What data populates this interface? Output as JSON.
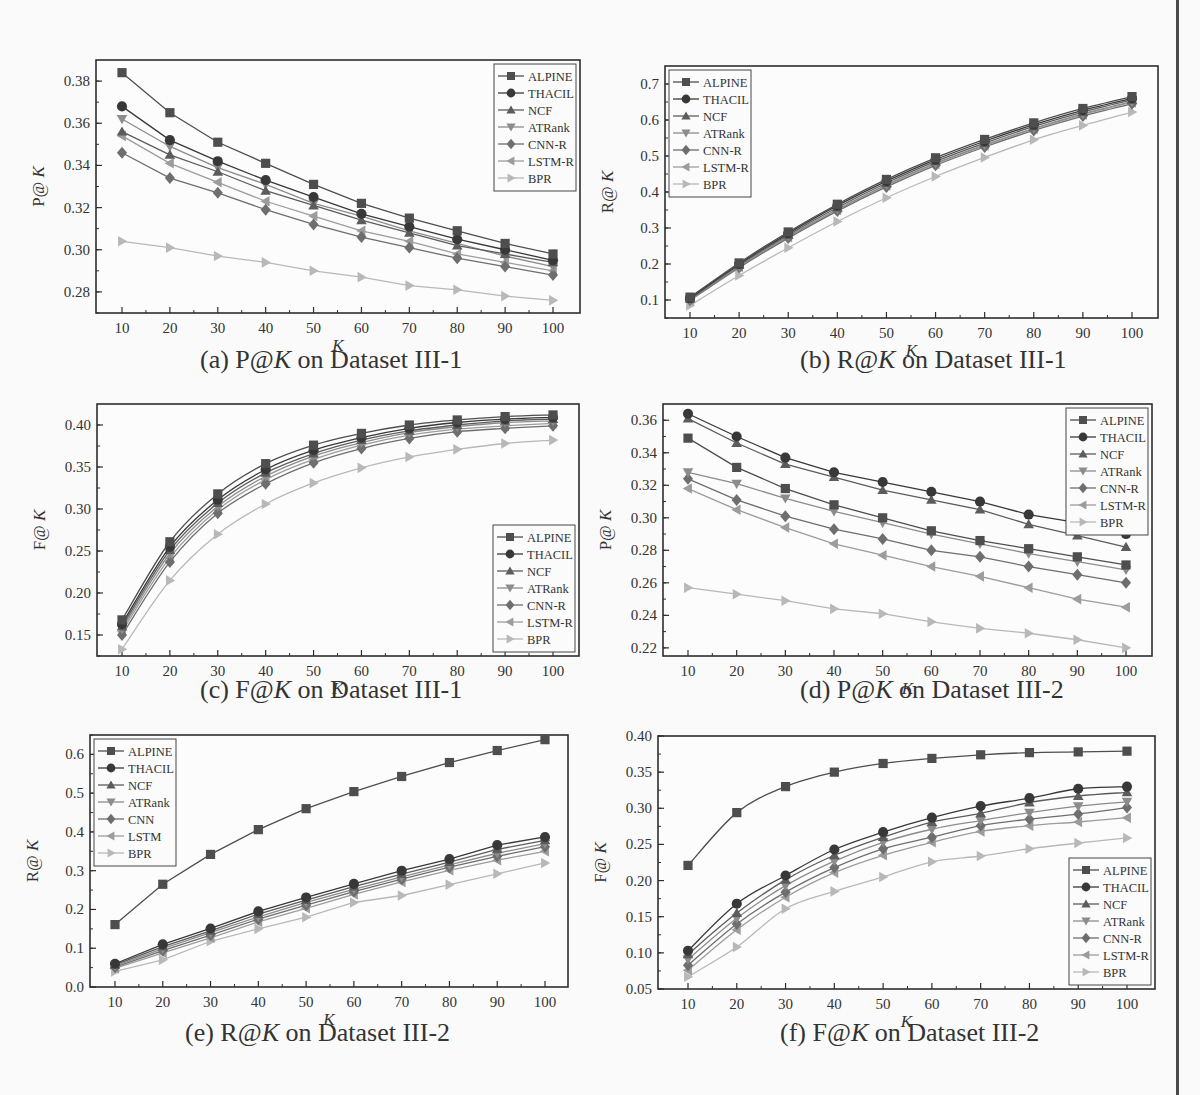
{
  "figure": {
    "series_names": [
      "ALPINE",
      "THACIL",
      "NCF",
      "ATRank",
      "CNN-R",
      "LSTM-R",
      "BPR"
    ],
    "series_styles": [
      {
        "marker": "square",
        "color": "#4e4e4e"
      },
      {
        "marker": "circle",
        "color": "#383838"
      },
      {
        "marker": "triangle-up",
        "color": "#5c5c5c"
      },
      {
        "marker": "triangle-down",
        "color": "#8c8c8c"
      },
      {
        "marker": "diamond",
        "color": "#6e6e6e"
      },
      {
        "marker": "triangle-left",
        "color": "#9c9c9c"
      },
      {
        "marker": "triangle-right",
        "color": "#b8b8b8"
      }
    ]
  },
  "chart_data": [
    {
      "id": "a",
      "type": "line",
      "caption_prefix": "(a) P@",
      "caption_italic": "K",
      "caption_suffix": " on Dataset III-1",
      "title": "(a) P@K on Dataset III-1",
      "xlabel": "K",
      "ylabel": "P@K",
      "x": [
        10,
        20,
        30,
        40,
        50,
        60,
        70,
        80,
        90,
        100
      ],
      "ylim": [
        0.27,
        0.39
      ],
      "yticks": [
        0.28,
        0.3,
        0.32,
        0.34,
        0.36,
        0.38
      ],
      "ytick_labels": [
        "0.28",
        "0.30",
        "0.32",
        "0.34",
        "0.36",
        "0.38"
      ],
      "yminor": 0.01,
      "grid": false,
      "legend_position": "upper-right",
      "smooth": false,
      "series": [
        {
          "name": "ALPINE",
          "values": [
            0.384,
            0.365,
            0.351,
            0.341,
            0.331,
            0.322,
            0.315,
            0.309,
            0.303,
            0.298
          ]
        },
        {
          "name": "THACIL",
          "values": [
            0.368,
            0.352,
            0.342,
            0.333,
            0.325,
            0.317,
            0.311,
            0.305,
            0.3,
            0.295
          ]
        },
        {
          "name": "NCF",
          "values": [
            0.356,
            0.345,
            0.337,
            0.328,
            0.321,
            0.314,
            0.308,
            0.302,
            0.298,
            0.294
          ]
        },
        {
          "name": "ATRank",
          "values": [
            0.362,
            0.349,
            0.339,
            0.331,
            0.322,
            0.316,
            0.309,
            0.303,
            0.297,
            0.292
          ]
        },
        {
          "name": "CNN-R",
          "values": [
            0.346,
            0.334,
            0.327,
            0.319,
            0.312,
            0.306,
            0.301,
            0.296,
            0.292,
            0.288
          ]
        },
        {
          "name": "LSTM-R",
          "values": [
            0.354,
            0.341,
            0.332,
            0.323,
            0.316,
            0.309,
            0.304,
            0.298,
            0.294,
            0.29
          ]
        },
        {
          "name": "BPR",
          "values": [
            0.304,
            0.301,
            0.297,
            0.294,
            0.29,
            0.287,
            0.283,
            0.281,
            0.278,
            0.276
          ]
        }
      ]
    },
    {
      "id": "b",
      "type": "line",
      "caption_prefix": "(b) R@",
      "caption_italic": "K",
      "caption_suffix": " on Dataset III-1",
      "title": "(b) R@K on Dataset III-1",
      "xlabel": "K",
      "ylabel": "R@K",
      "x": [
        10,
        20,
        30,
        40,
        50,
        60,
        70,
        80,
        90,
        100
      ],
      "ylim": [
        0.05,
        0.75
      ],
      "yticks": [
        0.1,
        0.2,
        0.3,
        0.4,
        0.5,
        0.6,
        0.7
      ],
      "ytick_labels": [
        "0.1",
        "0.2",
        "0.3",
        "0.4",
        "0.5",
        "0.6",
        "0.7"
      ],
      "yminor": 0.05,
      "grid": false,
      "legend_position": "upper-left",
      "smooth": true,
      "series": [
        {
          "name": "ALPINE",
          "values": [
            0.108,
            0.203,
            0.289,
            0.366,
            0.435,
            0.495,
            0.546,
            0.592,
            0.632,
            0.665
          ]
        },
        {
          "name": "THACIL",
          "values": [
            0.105,
            0.2,
            0.285,
            0.362,
            0.43,
            0.49,
            0.541,
            0.587,
            0.627,
            0.66
          ]
        },
        {
          "name": "NCF",
          "values": [
            0.103,
            0.197,
            0.281,
            0.357,
            0.425,
            0.485,
            0.536,
            0.582,
            0.622,
            0.656
          ]
        },
        {
          "name": "ATRank",
          "values": [
            0.101,
            0.194,
            0.277,
            0.352,
            0.42,
            0.48,
            0.531,
            0.577,
            0.617,
            0.651
          ]
        },
        {
          "name": "CNN-R",
          "values": [
            0.099,
            0.19,
            0.272,
            0.347,
            0.414,
            0.474,
            0.525,
            0.571,
            0.611,
            0.645
          ]
        },
        {
          "name": "LSTM-R",
          "values": [
            0.1,
            0.192,
            0.275,
            0.35,
            0.418,
            0.478,
            0.529,
            0.575,
            0.615,
            0.649
          ]
        },
        {
          "name": "BPR",
          "values": [
            0.085,
            0.168,
            0.245,
            0.318,
            0.384,
            0.443,
            0.496,
            0.545,
            0.585,
            0.622
          ]
        }
      ]
    },
    {
      "id": "c",
      "type": "line",
      "caption_prefix": "(c) F@",
      "caption_italic": "K",
      "caption_suffix": " on Dataset III-1",
      "title": "(c) F@K on Dataset III-1",
      "xlabel": "K",
      "ylabel": "F@K",
      "x": [
        10,
        20,
        30,
        40,
        50,
        60,
        70,
        80,
        90,
        100
      ],
      "ylim": [
        0.125,
        0.425
      ],
      "yticks": [
        0.15,
        0.2,
        0.25,
        0.3,
        0.35,
        0.4
      ],
      "ytick_labels": [
        "0.15",
        "0.20",
        "0.25",
        "0.30",
        "0.35",
        "0.40"
      ],
      "yminor": 0.025,
      "grid": false,
      "legend_position": "lower-right",
      "smooth": true,
      "series": [
        {
          "name": "ALPINE",
          "values": [
            0.168,
            0.261,
            0.318,
            0.354,
            0.376,
            0.39,
            0.4,
            0.406,
            0.41,
            0.412
          ]
        },
        {
          "name": "THACIL",
          "values": [
            0.163,
            0.255,
            0.311,
            0.347,
            0.37,
            0.385,
            0.396,
            0.403,
            0.407,
            0.409
          ]
        },
        {
          "name": "NCF",
          "values": [
            0.16,
            0.251,
            0.307,
            0.343,
            0.366,
            0.382,
            0.393,
            0.4,
            0.405,
            0.407
          ]
        },
        {
          "name": "ATRank",
          "values": [
            0.157,
            0.247,
            0.303,
            0.339,
            0.363,
            0.379,
            0.391,
            0.398,
            0.403,
            0.405
          ]
        },
        {
          "name": "CNN-R",
          "values": [
            0.15,
            0.237,
            0.295,
            0.33,
            0.355,
            0.372,
            0.384,
            0.392,
            0.396,
            0.399
          ]
        },
        {
          "name": "LSTM-R",
          "values": [
            0.154,
            0.242,
            0.299,
            0.335,
            0.359,
            0.376,
            0.388,
            0.395,
            0.399,
            0.402
          ]
        },
        {
          "name": "BPR",
          "values": [
            0.133,
            0.215,
            0.27,
            0.306,
            0.331,
            0.349,
            0.362,
            0.371,
            0.378,
            0.382
          ]
        }
      ]
    },
    {
      "id": "d",
      "type": "line",
      "caption_prefix": "(d) P@",
      "caption_italic": "K",
      "caption_suffix": " on Dataset III-2",
      "title": "(d) P@K on Dataset III-2",
      "xlabel": "K",
      "ylabel": "P@K",
      "x": [
        10,
        20,
        30,
        40,
        50,
        60,
        70,
        80,
        90,
        100
      ],
      "ylim": [
        0.215,
        0.37
      ],
      "yticks": [
        0.22,
        0.24,
        0.26,
        0.28,
        0.3,
        0.32,
        0.34,
        0.36
      ],
      "ytick_labels": [
        "0.22",
        "0.24",
        "0.26",
        "0.28",
        "0.30",
        "0.32",
        "0.34",
        "0.36"
      ],
      "yminor": 0.01,
      "grid": false,
      "legend_position": "upper-right",
      "smooth": false,
      "series": [
        {
          "name": "ALPINE",
          "values": [
            0.349,
            0.331,
            0.318,
            0.308,
            0.3,
            0.292,
            0.286,
            0.281,
            0.276,
            0.271
          ]
        },
        {
          "name": "THACIL",
          "values": [
            0.364,
            0.35,
            0.337,
            0.328,
            0.322,
            0.316,
            0.31,
            0.302,
            0.297,
            0.29
          ]
        },
        {
          "name": "NCF",
          "values": [
            0.361,
            0.346,
            0.333,
            0.325,
            0.317,
            0.311,
            0.305,
            0.296,
            0.289,
            0.282
          ]
        },
        {
          "name": "ATRank",
          "values": [
            0.328,
            0.321,
            0.312,
            0.304,
            0.297,
            0.29,
            0.284,
            0.278,
            0.273,
            0.268
          ]
        },
        {
          "name": "CNN-R",
          "values": [
            0.324,
            0.311,
            0.301,
            0.293,
            0.287,
            0.28,
            0.276,
            0.27,
            0.265,
            0.26
          ]
        },
        {
          "name": "LSTM-R",
          "values": [
            0.318,
            0.305,
            0.294,
            0.284,
            0.277,
            0.27,
            0.264,
            0.257,
            0.25,
            0.245
          ]
        },
        {
          "name": "BPR",
          "values": [
            0.257,
            0.253,
            0.249,
            0.244,
            0.241,
            0.236,
            0.232,
            0.229,
            0.225,
            0.22
          ]
        }
      ]
    },
    {
      "id": "e",
      "type": "line",
      "caption_prefix": "(e) R@",
      "caption_italic": "K",
      "caption_suffix": " on Dataset III-2",
      "title": "(e) R@K on Dataset III-2",
      "xlabel": "K",
      "ylabel": "R@K",
      "x": [
        10,
        20,
        30,
        40,
        50,
        60,
        70,
        80,
        90,
        100
      ],
      "ylim": [
        0.0,
        0.65
      ],
      "yticks": [
        0.0,
        0.1,
        0.2,
        0.3,
        0.4,
        0.5,
        0.6
      ],
      "ytick_labels": [
        "0.0",
        "0.1",
        "0.2",
        "0.3",
        "0.4",
        "0.5",
        "0.6"
      ],
      "yminor": 0.05,
      "grid": false,
      "legend_position": "upper-left",
      "legend_labels": [
        "ALPINE",
        "THACIL",
        "NCF",
        "ATRank",
        "CNN",
        "LSTM",
        "BPR"
      ],
      "smooth": false,
      "series": [
        {
          "name": "ALPINE",
          "values": [
            0.161,
            0.265,
            0.342,
            0.406,
            0.46,
            0.504,
            0.543,
            0.579,
            0.61,
            0.638
          ]
        },
        {
          "name": "THACIL",
          "values": [
            0.06,
            0.11,
            0.151,
            0.195,
            0.231,
            0.266,
            0.3,
            0.33,
            0.366,
            0.387
          ]
        },
        {
          "name": "NCF",
          "values": [
            0.057,
            0.104,
            0.145,
            0.188,
            0.224,
            0.259,
            0.291,
            0.322,
            0.355,
            0.378
          ]
        },
        {
          "name": "ATRank",
          "values": [
            0.054,
            0.099,
            0.14,
            0.181,
            0.218,
            0.252,
            0.284,
            0.315,
            0.345,
            0.37
          ]
        },
        {
          "name": "CNN",
          "values": [
            0.051,
            0.094,
            0.134,
            0.175,
            0.211,
            0.246,
            0.278,
            0.309,
            0.337,
            0.362
          ]
        },
        {
          "name": "LSTM",
          "values": [
            0.048,
            0.088,
            0.127,
            0.168,
            0.203,
            0.239,
            0.271,
            0.301,
            0.327,
            0.35
          ]
        },
        {
          "name": "BPR",
          "values": [
            0.04,
            0.07,
            0.118,
            0.15,
            0.18,
            0.218,
            0.236,
            0.264,
            0.292,
            0.32
          ]
        }
      ]
    },
    {
      "id": "f",
      "type": "line",
      "caption_prefix": "(f) F@",
      "caption_italic": "K",
      "caption_suffix": " on Dataset III-2",
      "title": "(f) F@K on Dataset III-2",
      "xlabel": "K",
      "ylabel": "F@K",
      "x": [
        10,
        20,
        30,
        40,
        50,
        60,
        70,
        80,
        90,
        100
      ],
      "ylim": [
        0.05,
        0.4
      ],
      "yticks": [
        0.05,
        0.1,
        0.15,
        0.2,
        0.25,
        0.3,
        0.35,
        0.4
      ],
      "ytick_labels": [
        "0.05",
        "0.10",
        "0.15",
        "0.20",
        "0.25",
        "0.30",
        "0.35",
        "0.40"
      ],
      "yminor": 0.025,
      "grid": false,
      "legend_position": "lower-right",
      "smooth": true,
      "series": [
        {
          "name": "ALPINE",
          "values": [
            0.221,
            0.294,
            0.33,
            0.35,
            0.362,
            0.369,
            0.374,
            0.377,
            0.378,
            0.379
          ]
        },
        {
          "name": "THACIL",
          "values": [
            0.103,
            0.168,
            0.207,
            0.243,
            0.267,
            0.287,
            0.303,
            0.314,
            0.327,
            0.33
          ]
        },
        {
          "name": "NCF",
          "values": [
            0.098,
            0.155,
            0.201,
            0.235,
            0.26,
            0.281,
            0.293,
            0.308,
            0.317,
            0.322
          ]
        },
        {
          "name": "ATRank",
          "values": [
            0.091,
            0.148,
            0.193,
            0.227,
            0.253,
            0.271,
            0.283,
            0.294,
            0.303,
            0.309
          ]
        },
        {
          "name": "CNN-R",
          "values": [
            0.083,
            0.14,
            0.184,
            0.218,
            0.244,
            0.26,
            0.276,
            0.285,
            0.292,
            0.301
          ]
        },
        {
          "name": "LSTM-R",
          "values": [
            0.076,
            0.132,
            0.177,
            0.211,
            0.235,
            0.253,
            0.268,
            0.276,
            0.281,
            0.287
          ]
        },
        {
          "name": "BPR",
          "values": [
            0.067,
            0.108,
            0.161,
            0.185,
            0.205,
            0.226,
            0.234,
            0.244,
            0.252,
            0.259
          ]
        }
      ]
    }
  ],
  "layout_panels": [
    {
      "id": "a",
      "frame": [
        96,
        60,
        580,
        313
      ],
      "xtick_first": 122,
      "xtick_last": 553,
      "caption_xy": [
        200,
        345
      ]
    },
    {
      "id": "b",
      "frame": [
        665,
        66,
        1158,
        318
      ],
      "xtick_first": 690,
      "xtick_last": 1132,
      "caption_xy": [
        800,
        345
      ]
    },
    {
      "id": "c",
      "frame": [
        97,
        404,
        579,
        656
      ],
      "xtick_first": 122,
      "xtick_last": 553,
      "caption_xy": [
        200,
        675
      ]
    },
    {
      "id": "d",
      "frame": [
        663,
        404,
        1152,
        656
      ],
      "xtick_first": 688,
      "xtick_last": 1126,
      "caption_xy": [
        800,
        675
      ]
    },
    {
      "id": "e",
      "frame": [
        90,
        735,
        568,
        987
      ],
      "xtick_first": 115,
      "xtick_last": 545,
      "caption_xy": [
        185,
        1018
      ]
    },
    {
      "id": "f",
      "frame": [
        658,
        736,
        1155,
        989
      ],
      "xtick_first": 688,
      "xtick_last": 1127,
      "caption_xy": [
        780,
        1018
      ]
    }
  ]
}
